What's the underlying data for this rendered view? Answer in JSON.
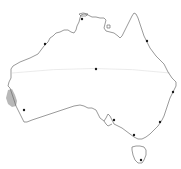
{
  "map": {
    "title": "",
    "region": "Australia",
    "colors": {
      "background": "#ffffff",
      "coastline": "#6e6e6e",
      "latitude_line": "#e6e6e6",
      "shaded_region": "#b8b8b8",
      "marker": "#1a1a1a"
    },
    "latitude_line": {
      "y": 69
    },
    "shaded_region": {
      "description": "shaded area on west coast"
    },
    "markers": [
      {
        "name": "marker-north",
        "x": 82,
        "y": 19
      },
      {
        "name": "marker-northwest",
        "x": 45,
        "y": 44
      },
      {
        "name": "marker-northeast",
        "x": 147,
        "y": 41
      },
      {
        "name": "marker-center",
        "x": 96,
        "y": 69
      },
      {
        "name": "marker-east",
        "x": 173,
        "y": 92
      },
      {
        "name": "marker-west",
        "x": 24,
        "y": 110
      },
      {
        "name": "marker-south-central",
        "x": 114,
        "y": 120
      },
      {
        "name": "marker-southeast",
        "x": 160,
        "y": 122
      },
      {
        "name": "marker-south",
        "x": 134,
        "y": 135
      },
      {
        "name": "marker-tasmania",
        "x": 141,
        "y": 160
      }
    ]
  }
}
